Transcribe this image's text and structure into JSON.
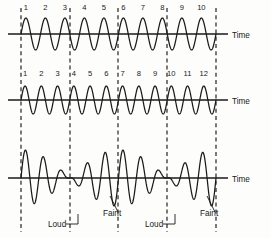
{
  "figure": {
    "width": 271,
    "height": 238,
    "background_color": "#fdfdfb",
    "ink_color": "#1a1a1a"
  },
  "axes": {
    "time_caption": "Time",
    "captions": [
      "Time",
      "Time",
      "Time"
    ],
    "caption_x": 232,
    "caption_y": [
      38,
      104,
      182
    ],
    "baseline_y": [
      34,
      100,
      178
    ],
    "axis_start_x": 8,
    "axis_end_x": 228
  },
  "dividers": {
    "x_positions": [
      21,
      70,
      118,
      167,
      216
    ],
    "y_top": 8,
    "y_bottom": 232,
    "dash": "4 3.2",
    "count": 5
  },
  "waves": [
    {
      "name": "wave-upper",
      "cycles": 10,
      "amplitude": 16,
      "baseline_y": 34,
      "start_x": 21,
      "end_x": 216,
      "cycle_labels": [
        "1",
        "2",
        "3",
        "4",
        "5",
        "6",
        "7",
        "8",
        "9",
        "10"
      ],
      "label_y": 10
    },
    {
      "name": "wave-middle",
      "cycles": 12,
      "amplitude": 14,
      "baseline_y": 100,
      "start_x": 21,
      "end_x": 216,
      "cycle_labels": [
        "1",
        "2",
        "3",
        "4",
        "5",
        "6",
        "7",
        "8",
        "9",
        "10",
        "11",
        "12"
      ],
      "label_y": 76
    },
    {
      "name": "wave-resultant",
      "cycles": 11,
      "amplitude": 30,
      "baseline_y": 178,
      "start_x": 21,
      "end_x": 216,
      "beat_count": 2,
      "cycle_labels": [],
      "label_y": 0
    }
  ],
  "annotations": [
    {
      "label": "Loud",
      "text_x": 48,
      "text_y": 227,
      "leader_from_x": 66,
      "leader_from_y": 224,
      "leader_to_x": 78,
      "leader_to_y": 224,
      "tick_x": 78,
      "tick_y1": 224,
      "tick_y2": 214
    },
    {
      "label": "Faint",
      "text_x": 103,
      "text_y": 216,
      "leader_from_x": 118,
      "leader_from_y": 212,
      "leader_to_x": 110,
      "leader_to_y": 196,
      "tick_x": 0,
      "tick_y1": 0,
      "tick_y2": 0
    },
    {
      "label": "Loud",
      "text_x": 145,
      "text_y": 227,
      "leader_from_x": 163,
      "leader_from_y": 224,
      "leader_to_x": 175,
      "leader_to_y": 224,
      "tick_x": 175,
      "tick_y1": 224,
      "tick_y2": 214
    },
    {
      "label": "Faint",
      "text_x": 200,
      "text_y": 216,
      "leader_from_x": 215,
      "leader_from_y": 212,
      "leader_to_x": 207,
      "leader_to_y": 196,
      "tick_x": 0,
      "tick_y1": 0,
      "tick_y2": 0
    }
  ],
  "chart_data": {
    "type": "line",
    "xlabel": "Time",
    "ylabel": "",
    "grid": false,
    "legend": "none",
    "series": [
      {
        "name": "Wave 1 (10 cycles)",
        "description": "Lower-frequency sinusoid, 10 complete cycles over the interval",
        "cycles": 10,
        "amplitude": 16,
        "cycle_markers": [
          "1",
          "2",
          "3",
          "4",
          "5",
          "6",
          "7",
          "8",
          "9",
          "10"
        ]
      },
      {
        "name": "Wave 2 (12 cycles)",
        "description": "Higher-frequency sinusoid, 12 complete cycles over the same interval",
        "cycles": 12,
        "amplitude": 14,
        "cycle_markers": [
          "1",
          "2",
          "3",
          "4",
          "5",
          "6",
          "7",
          "8",
          "9",
          "10",
          "11",
          "12"
        ]
      },
      {
        "name": "Resultant (beats)",
        "description": "Sum of wave 1 and wave 2 showing two beat cycles with Loud maxima and Faint minima",
        "beats": 2,
        "max_amplitude": 30,
        "annotations": [
          "Loud",
          "Faint",
          "Loud",
          "Faint"
        ]
      }
    ],
    "beat_boundaries_x": [
      21,
      70,
      118,
      167,
      216
    ],
    "xlim": [
      21,
      216
    ]
  }
}
